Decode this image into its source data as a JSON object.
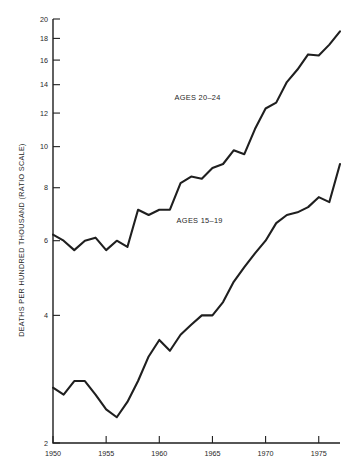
{
  "chart_data": {
    "type": "line",
    "title": "",
    "subtitle": "",
    "xlabel": "",
    "ylabel": "DEATHS PER HUNDRED THOUSAND (RATIO SCALE)",
    "y_scale": "log",
    "ylim": [
      2,
      20
    ],
    "xlim": [
      1950,
      1977
    ],
    "grid": false,
    "legend_position": "inline-annotation",
    "y_ticks": [
      2,
      4,
      6,
      8,
      10,
      12,
      14,
      16,
      18,
      20
    ],
    "y_tick_labels": [
      "2",
      "4",
      "6",
      "8",
      "10",
      "12",
      "14",
      "16",
      "18",
      "20"
    ],
    "x_ticks": [
      1950,
      1955,
      1960,
      1965,
      1970,
      1975
    ],
    "x_tick_labels": [
      "1950",
      "1955",
      "1960",
      "1965",
      "1970",
      "1975"
    ],
    "x": [
      1950,
      1951,
      1952,
      1953,
      1954,
      1955,
      1956,
      1957,
      1958,
      1959,
      1960,
      1961,
      1962,
      1963,
      1964,
      1965,
      1966,
      1967,
      1968,
      1969,
      1970,
      1971,
      1972,
      1973,
      1974,
      1975,
      1976,
      1977
    ],
    "series": [
      {
        "name": "AGES 20-24",
        "label": "AGES 20–24",
        "color": "#1f1f1f",
        "annotation_x": 1963.6,
        "annotation_y": 12.9,
        "values": [
          6.2,
          6.0,
          5.7,
          6.0,
          6.1,
          5.7,
          6.0,
          5.8,
          7.1,
          6.9,
          7.1,
          7.1,
          8.2,
          8.5,
          8.4,
          8.9,
          9.1,
          9.8,
          9.6,
          11.0,
          12.3,
          12.7,
          14.2,
          15.2,
          16.5,
          16.4,
          17.4,
          18.7
        ]
      },
      {
        "name": "AGES 15-19",
        "label": "AGES 15–19",
        "color": "#1f1f1f",
        "annotation_x": 1963.8,
        "annotation_y": 6.6,
        "values": [
          2.7,
          2.6,
          2.8,
          2.8,
          2.6,
          2.4,
          2.3,
          2.5,
          2.8,
          3.2,
          3.5,
          3.3,
          3.6,
          3.8,
          4.0,
          4.0,
          4.3,
          4.8,
          5.2,
          5.6,
          6.0,
          6.6,
          6.9,
          7.0,
          7.2,
          7.6,
          7.4,
          9.1
        ]
      }
    ]
  }
}
